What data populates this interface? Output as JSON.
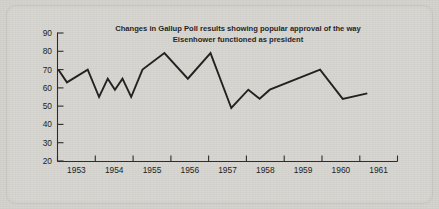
{
  "figure": {
    "background_color": "#d4d2cd",
    "ink_color": "#231f20",
    "title_line1": "Changes in Gallup Poll results showing popular approval of the way",
    "title_line2": "Eisenhower functioned as president"
  },
  "chart_data": {
    "type": "line",
    "title": "Changes in Gallup Poll results showing popular approval of the way Eisenhower functioned as president",
    "xlabel": "",
    "ylabel": "",
    "xlim": [
      1952.5,
      1961.5
    ],
    "ylim": [
      20,
      90
    ],
    "grid": false,
    "legend": null,
    "ytick_labels": [
      "90",
      "80",
      "70",
      "60",
      "50",
      "40",
      "30",
      "20"
    ],
    "yticks": [
      90,
      80,
      70,
      60,
      50,
      40,
      30,
      20
    ],
    "xtick_labels": [
      "1953",
      "1954",
      "1955",
      "1956",
      "1957",
      "1958",
      "1959",
      "1960",
      "1961"
    ],
    "xticks": [
      1953,
      1954,
      1955,
      1956,
      1957,
      1958,
      1959,
      1960,
      1961
    ],
    "series": [
      {
        "name": "Approval of Eisenhower (Gallup %)",
        "x": [
          1952.52,
          1952.75,
          1953.3,
          1953.6,
          1953.83,
          1954.02,
          1954.22,
          1954.45,
          1954.75,
          1955.33,
          1955.95,
          1956.55,
          1957.1,
          1957.55,
          1957.85,
          1958.12,
          1959.45,
          1960.05,
          1960.7
        ],
        "values": [
          70,
          63,
          70,
          55,
          65,
          59,
          65,
          55,
          70,
          79,
          65,
          79,
          49,
          59,
          54,
          59,
          70,
          54,
          57
        ]
      }
    ]
  }
}
